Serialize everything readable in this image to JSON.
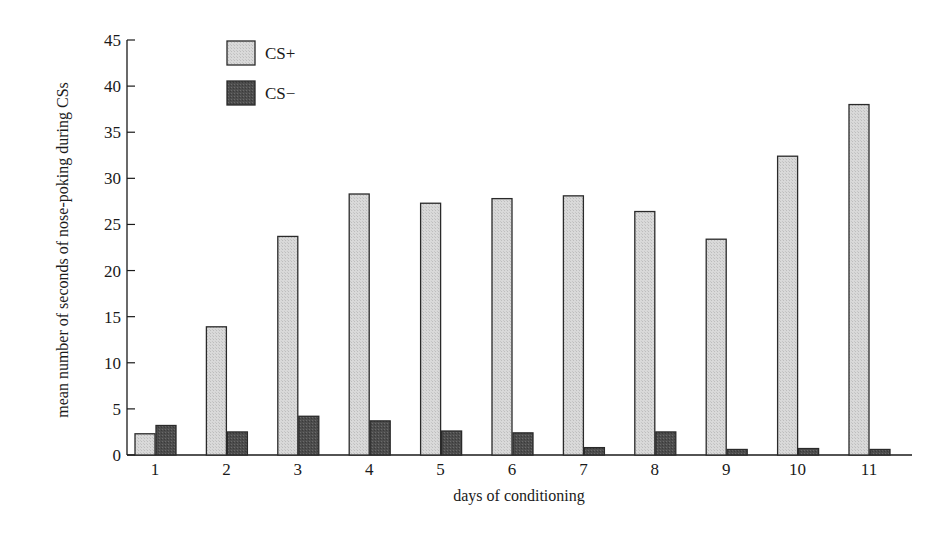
{
  "chart_data": {
    "type": "bar",
    "title": "",
    "xlabel": "days of conditioning",
    "ylabel": "mean number of seconds of nose-poking during CSs",
    "ylim": [
      0,
      45
    ],
    "yticks": [
      0,
      5,
      10,
      15,
      20,
      25,
      30,
      35,
      40,
      45
    ],
    "grid": false,
    "legend_position": "top-left inside",
    "categories": [
      "1",
      "2",
      "3",
      "4",
      "5",
      "6",
      "7",
      "8",
      "9",
      "10",
      "11"
    ],
    "series": [
      {
        "name": "CS+",
        "color": "#d4d4d4",
        "values": [
          2.3,
          13.9,
          23.7,
          28.3,
          27.3,
          27.8,
          28.1,
          26.4,
          23.4,
          32.4,
          38.0
        ]
      },
      {
        "name": "CS−",
        "color": "#505050",
        "values": [
          3.2,
          2.5,
          4.2,
          3.7,
          2.6,
          2.4,
          0.8,
          2.5,
          0.6,
          0.7,
          0.6
        ]
      }
    ]
  },
  "legend": {
    "items": [
      {
        "label": "CS+",
        "color": "#d4d4d4"
      },
      {
        "label": "CS−",
        "color": "#505050"
      }
    ]
  }
}
